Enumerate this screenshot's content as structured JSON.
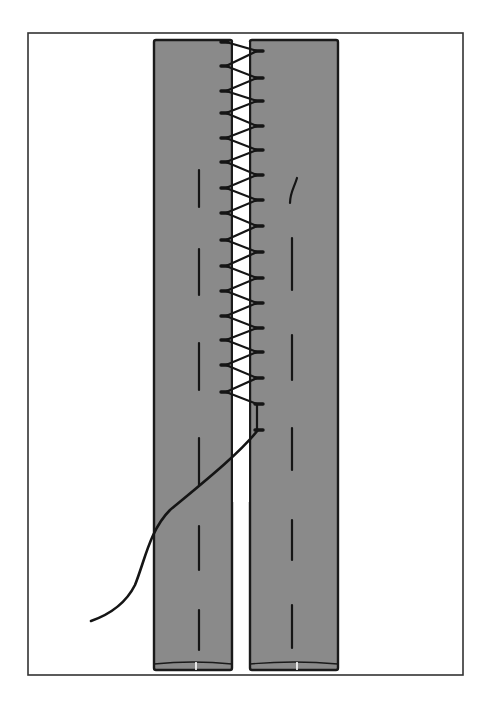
{
  "diagram": {
    "type": "sewing-technique-illustration",
    "colors": {
      "background": "#ffffff",
      "frame": "#333333",
      "fabric": "#8a8a8a",
      "outline": "#1a1a1a",
      "thread": "#151515",
      "gap": "#ffffff"
    },
    "frame": {
      "x": 28,
      "y": 33,
      "width": 435,
      "height": 642
    },
    "strips": [
      {
        "name": "left-strip",
        "x": 154,
        "y": 40,
        "width": 78,
        "height": 630,
        "dash_x": 199,
        "dashes": [
          [
            170,
            207
          ],
          [
            249,
            295
          ],
          [
            343,
            390
          ],
          [
            438,
            485
          ],
          [
            526,
            570
          ],
          [
            610,
            650
          ]
        ]
      },
      {
        "name": "right-strip",
        "x": 250,
        "y": 40,
        "width": 88,
        "height": 630,
        "dash_x": 292,
        "dashes": [
          [
            238,
            290
          ],
          [
            335,
            380
          ],
          [
            428,
            470
          ],
          [
            520,
            560
          ],
          [
            605,
            648
          ]
        ]
      }
    ],
    "stitch": {
      "left_x": 226,
      "right_x": 257,
      "left_points_y": [
        42,
        66,
        91,
        113,
        138,
        162,
        188,
        213,
        240,
        266,
        291,
        316,
        340,
        365,
        392
      ],
      "right_points_y": [
        51,
        78,
        101,
        126,
        150,
        175,
        200,
        226,
        252,
        278,
        303,
        328,
        352,
        378,
        404,
        430
      ]
    },
    "thread_tail_top": "M 290 203 C 290 193, 294 188, 297 178",
    "thread_exit": "M 258 430 C 238 455, 200 485, 170 510 C 150 530, 145 560, 135 585 C 125 605, 108 615, 91 621"
  }
}
